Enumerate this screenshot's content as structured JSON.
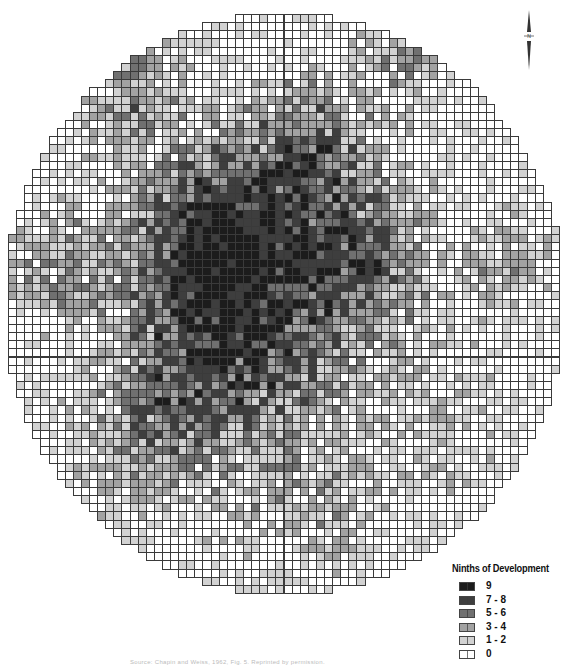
{
  "figure": {
    "type": "grid-cell choropleth map",
    "shape": "circular study area",
    "grid": {
      "left": 8,
      "top": 14,
      "right": 559,
      "bottom": 593,
      "cols": 68,
      "rows": 71,
      "center": [
        284,
        303
      ],
      "radius_x": 280,
      "radius_y": 290,
      "seed": 1962,
      "hotspots": [
        {
          "x": 0.42,
          "y": 0.52,
          "r": 0.22,
          "w": 4.6
        },
        {
          "x": 0.36,
          "y": 0.36,
          "r": 0.14,
          "w": 3.2
        },
        {
          "x": 0.55,
          "y": 0.22,
          "r": 0.14,
          "w": 3.0
        },
        {
          "x": 0.66,
          "y": 0.42,
          "r": 0.12,
          "w": 2.6
        },
        {
          "x": 0.22,
          "y": 0.12,
          "r": 0.1,
          "w": 2.6
        },
        {
          "x": 0.72,
          "y": 0.05,
          "r": 0.08,
          "w": 2.4
        },
        {
          "x": 0.08,
          "y": 0.42,
          "r": 0.1,
          "w": 2.2
        },
        {
          "x": 0.9,
          "y": 0.42,
          "r": 0.08,
          "w": 2.0
        },
        {
          "x": 0.25,
          "y": 0.72,
          "r": 0.14,
          "w": 2.2
        },
        {
          "x": 0.55,
          "y": 0.85,
          "r": 0.14,
          "w": 1.6
        },
        {
          "x": 0.8,
          "y": 0.7,
          "r": 0.12,
          "w": 1.4
        }
      ]
    },
    "north_arrow": {
      "label": "N"
    }
  },
  "legend": {
    "title": "Ninths of Development",
    "items": [
      {
        "label": "9",
        "color": "#1c1c1c"
      },
      {
        "label": "7 - 8",
        "color": "#3e3e3e"
      },
      {
        "label": "5 - 6",
        "color": "#707070"
      },
      {
        "label": "3 - 4",
        "color": "#a2a2a2"
      },
      {
        "label": "1 - 2",
        "color": "#d2d2d2"
      },
      {
        "label": "0",
        "color": "#ffffff"
      }
    ]
  },
  "caption": {
    "text": "Source: Chapin and Weiss, 1962, Fig. 5. Reprinted by permission."
  }
}
